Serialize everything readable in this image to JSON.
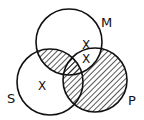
{
  "diagram": {
    "type": "venn",
    "sets": [
      {
        "label": "M",
        "cx": 69,
        "cy": 42,
        "r": 33
      },
      {
        "label": "S",
        "cx": 50,
        "cy": 82,
        "r": 33
      },
      {
        "label": "P",
        "cx": 95,
        "cy": 80,
        "r": 32
      }
    ],
    "labels": {
      "m": "M",
      "s": "S",
      "p": "P"
    },
    "marks": {
      "x1": "X",
      "x2": "X",
      "x3": "X"
    },
    "shaded_regions": [
      "S∩M",
      "S∩M∩P",
      "P only",
      "S∩P"
    ],
    "x_regions": [
      "S only",
      "M∩P (not S)",
      "M∩P (not S)"
    ],
    "colors": {
      "stroke": "#111111",
      "fill": "#ffffff",
      "hatch": "#111111"
    }
  }
}
